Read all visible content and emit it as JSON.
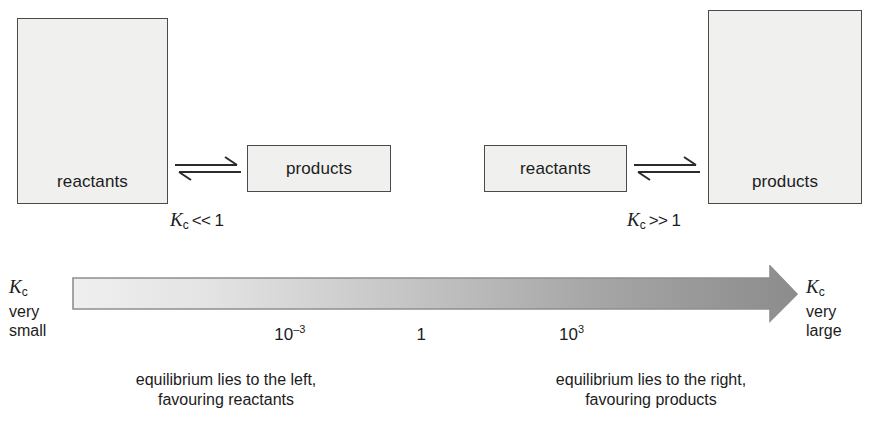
{
  "panels": [
    {
      "id": "left",
      "reactants_label": "reactants",
      "products_label": "products",
      "kc_symbol": "K",
      "kc_subscript": "c",
      "kc_relation": "<<",
      "kc_value": "1",
      "caption_line1": "equilibrium lies to the left,",
      "caption_line2": "favouring reactants",
      "arrow_icon": "equilibrium-double-arrow"
    },
    {
      "id": "right",
      "reactants_label": "reactants",
      "products_label": "products",
      "kc_symbol": "K",
      "kc_subscript": "c",
      "kc_relation": ">>",
      "kc_value": "1",
      "caption_line1": "equilibrium lies to the right,",
      "caption_line2": "favouring products",
      "arrow_icon": "equilibrium-double-arrow"
    }
  ],
  "scale": {
    "icon": "gradient-right-arrow",
    "left_label": {
      "kc_symbol": "K",
      "kc_subscript": "c",
      "line2": "very",
      "line3": "small"
    },
    "right_label": {
      "kc_symbol": "K",
      "kc_subscript": "c",
      "line2": "very",
      "line3": "large"
    },
    "ticks": [
      {
        "mantissa": "10",
        "exponent": "–3",
        "plain": "10–3",
        "x_pct": 30.0
      },
      {
        "mantissa": "1",
        "exponent": "",
        "plain": "1",
        "x_pct": 48.1
      },
      {
        "mantissa": "10",
        "exponent": "3",
        "plain": "103",
        "x_pct": 68.8
      }
    ],
    "gradient_start_color": "#eeeeee",
    "gradient_end_color": "#8c8c8c",
    "border_color": "#8a8a8a"
  },
  "chart_data": {
    "type": "scale-bar",
    "xlabel": "Kc",
    "axis_direction": "left-to-right, increasing Kc",
    "tick_labels": [
      "10–3",
      "1",
      "10³"
    ],
    "tick_values": [
      0.001,
      1,
      1000
    ],
    "endpoint_labels": [
      "Kc very small",
      "Kc very large"
    ],
    "annotations": [
      "Kc << 1: equilibrium lies to the left, favouring reactants",
      "Kc >> 1: equilibrium lies to the right, favouring products"
    ],
    "grid": false,
    "legend": "none"
  },
  "style": {
    "box_fill": "#f0f0ef",
    "box_border": "#4a4a4a",
    "text_color": "#1c1c1c",
    "background": "#ffffff"
  }
}
